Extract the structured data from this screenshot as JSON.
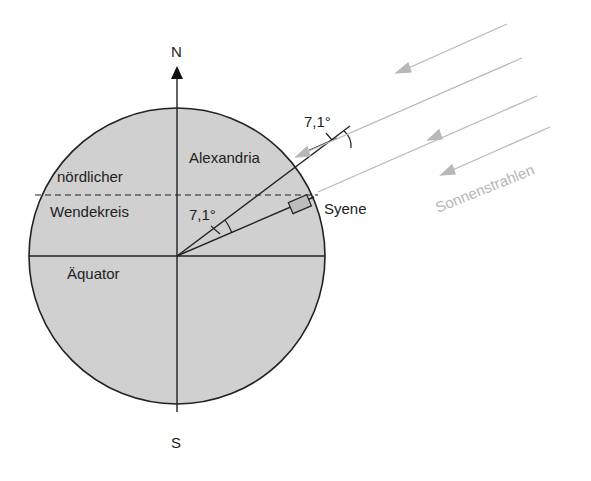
{
  "diagram": {
    "compass": {
      "north": "N",
      "south": "S"
    },
    "labels": {
      "tropic_line1": "nördlicher",
      "tropic_line2": "Wendekreis",
      "equator": "Äquator",
      "alexandria": "Alexandria",
      "syene": "Syene",
      "angle_center": "7,1°",
      "angle_shadow": "7,1°",
      "sun_rays": "Sonnenstrahlen"
    },
    "colors": {
      "earth_fill": "#d0d0d0",
      "line": "#222222",
      "sun_ray": "#b8b8b8",
      "background": "#ffffff"
    },
    "geometry": {
      "center": [
        177,
        256
      ],
      "radius": 148,
      "angle_degrees": 7.1
    }
  }
}
